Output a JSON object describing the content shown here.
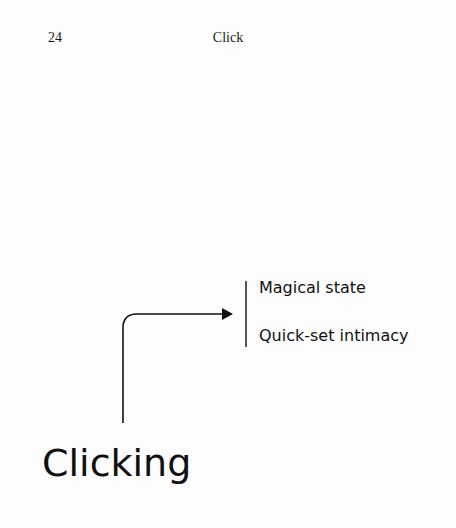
{
  "header": {
    "page_number": "24",
    "running_title": "Click"
  },
  "diagram": {
    "source_label": "Clicking",
    "targets": [
      {
        "label": "Magical state"
      },
      {
        "label": "Quick-set intimacy"
      }
    ]
  }
}
